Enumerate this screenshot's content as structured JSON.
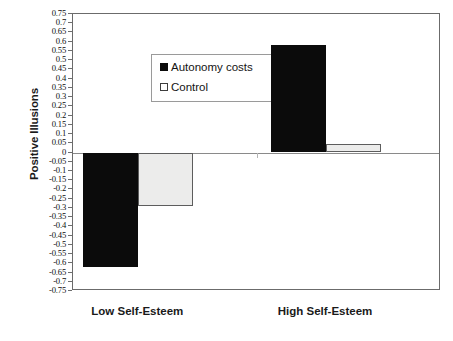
{
  "chart_data": {
    "type": "bar",
    "title": "",
    "xlabel": "",
    "ylabel": "Positive Illusions",
    "categories": [
      "Low Self-Esteem",
      "High Self-Esteem"
    ],
    "series": [
      {
        "name": "Autonomy costs",
        "values": [
          -0.62,
          0.58
        ],
        "color": "#0b0b0b",
        "swatch": "filled-square"
      },
      {
        "name": "Control",
        "values": [
          -0.29,
          0.045
        ],
        "color": "#ececeb",
        "swatch": "open-square"
      }
    ],
    "ylim": [
      -0.75,
      0.75
    ],
    "ytick_step": 0.05,
    "yticks": [
      "0.75",
      "0.7",
      "0.65",
      "0.6",
      "0.55",
      "0.5",
      "0.45",
      "0.4",
      "0.35",
      "0.3",
      "0.25",
      "0.2",
      "0.15",
      "0.1",
      "0.05",
      "0",
      "-0.05",
      "-0.1",
      "-0.15",
      "-0.2",
      "-0.25",
      "-0.3",
      "-0.35",
      "-0.4",
      "-0.45",
      "-0.5",
      "-0.55",
      "-0.6",
      "-0.65",
      "-0.7",
      "-0.75"
    ],
    "ytick_values": [
      0.75,
      0.7,
      0.65,
      0.6,
      0.55,
      0.5,
      0.45,
      0.4,
      0.35,
      0.3,
      0.25,
      0.2,
      0.15,
      0.1,
      0.05,
      0,
      -0.05,
      -0.1,
      -0.15,
      -0.2,
      -0.25,
      -0.3,
      -0.35,
      -0.4,
      -0.45,
      -0.5,
      -0.55,
      -0.6,
      -0.65,
      -0.7,
      -0.75
    ],
    "grid": false,
    "zero_line": true,
    "legend_position": "upper-left-inside"
  },
  "legend": {
    "items": [
      {
        "label": "Autonomy costs"
      },
      {
        "label": "Control"
      }
    ]
  },
  "axes": {
    "y_title": "Positive Illusions",
    "x_categories": [
      {
        "label": "Low Self-Esteem"
      },
      {
        "label": "High Self-Esteem"
      }
    ]
  }
}
